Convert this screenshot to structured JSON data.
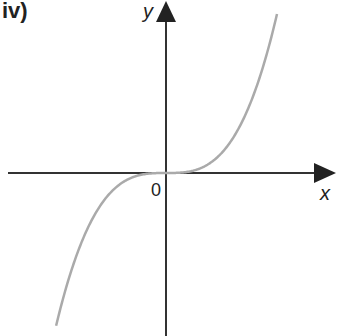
{
  "diagram": {
    "panel_label": "iv)",
    "x_axis_label": "x",
    "y_axis_label": "y",
    "origin_label": "0",
    "curve": {
      "description": "cubic curve y = k*x^3 passing through origin, rising from bottom-left to top-right",
      "function": "cubic",
      "color": "#aaaaaa"
    },
    "axis_color": "#222222"
  }
}
